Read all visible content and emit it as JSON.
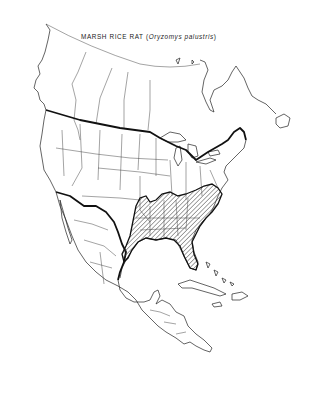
{
  "map": {
    "title_common": "MARSH RICE RAT",
    "title_scientific": "Oryzomys palustris",
    "title_open": "(",
    "title_close": ")",
    "region": "North America and Central America",
    "legend": {
      "range_pattern": "diagonal hatching",
      "range_meaning": "species distribution range"
    },
    "range_extent": "Southeastern United States, from eastern Texas north to Kansas/Missouri and Illinois, east to the Atlantic coast (New Jersey/Pennsylvania) and south through Florida",
    "colors": {
      "background": "#ffffff",
      "outline": "#222222",
      "hatch": "#333333"
    }
  }
}
